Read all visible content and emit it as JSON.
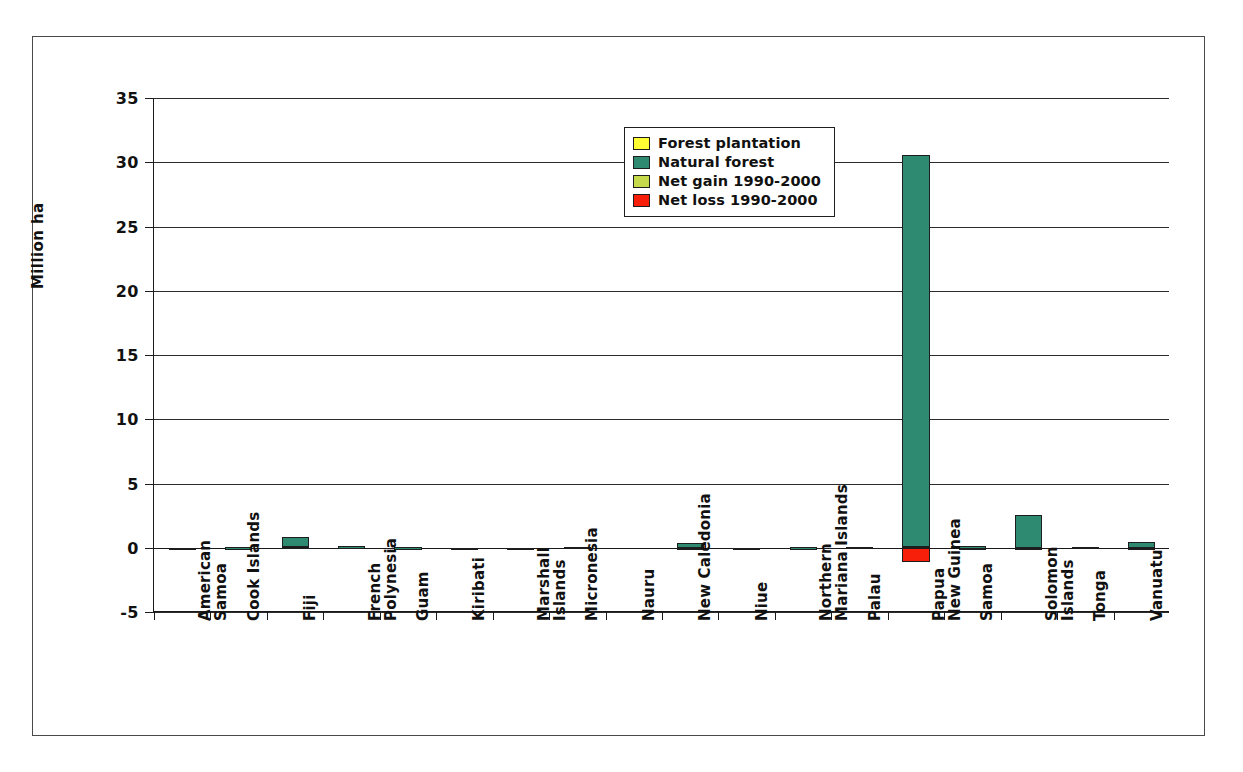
{
  "chart_data": {
    "type": "bar",
    "title": "",
    "subtitle": "",
    "xlabel": "",
    "ylabel": "Million ha",
    "ylim": [
      -5,
      35
    ],
    "ytick_step": 5,
    "yticks": [
      "35",
      "30",
      "25",
      "20",
      "15",
      "10",
      "5",
      "0",
      "-5"
    ],
    "grid": true,
    "stacked": true,
    "legend_position": "inside-top-center",
    "categories": [
      "American\nSamoa",
      "Cook Islands",
      "Fiji",
      "French\nPolynesia",
      "Guam",
      "Kiribati",
      "Marshall\nIslands",
      "Micronesia",
      "Nauru",
      "New Caledonia",
      "Niue",
      "Northern\nMariana Islands",
      "Palau",
      "Papua\nNew Guinea",
      "Samoa",
      "Solomon\nIslands",
      "Tonga",
      "Vanuatu"
    ],
    "series": [
      {
        "name": "Forest plantation",
        "color": "#ffff33",
        "values": [
          0,
          0,
          0.05,
          0,
          0,
          0,
          0,
          0,
          0,
          0.01,
          0,
          0,
          0,
          0.09,
          0.01,
          0.01,
          0,
          0.01
        ]
      },
      {
        "name": "Natural forest",
        "color": "#2e8b72",
        "values": [
          0.01,
          0.02,
          0.76,
          0.1,
          0.02,
          0.01,
          0.01,
          0.06,
          0,
          0.36,
          0.01,
          0.03,
          0.04,
          30.5,
          0.1,
          2.54,
          0.04,
          0.44
        ]
      },
      {
        "name": "Net gain 1990-2000",
        "color": "#c5d94a",
        "values": [
          0,
          0,
          0,
          0,
          0,
          0,
          0,
          0,
          0,
          0,
          0,
          0,
          0,
          0,
          0,
          0,
          0,
          0
        ]
      },
      {
        "name": "Net loss 1990-2000",
        "color": "#f81f0a",
        "values": [
          0,
          0,
          0,
          0,
          0,
          0,
          0,
          0,
          0,
          0,
          0,
          0,
          0,
          -1.1,
          0,
          0,
          0,
          0
        ]
      }
    ]
  },
  "legend": {
    "items": [
      {
        "label": "Forest plantation",
        "color": "#ffff33"
      },
      {
        "label": "Natural forest",
        "color": "#2e8b72"
      },
      {
        "label": "Net gain 1990-2000",
        "color": "#c5d94a"
      },
      {
        "label": "Net loss 1990-2000",
        "color": "#f81f0a"
      }
    ]
  },
  "axis": {
    "y_title": "Million ha"
  }
}
